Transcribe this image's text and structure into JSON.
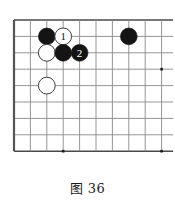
{
  "figure": {
    "caption": "图 36",
    "kind": "go-board-diagram"
  },
  "board": {
    "grid": {
      "origin_x": 14,
      "origin_y": 20,
      "spacing": 16.4,
      "cols": 10,
      "rows": 9,
      "line_color": "#8a8a8a",
      "edge_color": "#4a4a4a",
      "edge_left_color": "#555555",
      "background": "#ffffff"
    },
    "star_points": [
      {
        "name": "star-point-bottom-left",
        "col": 4,
        "row": 9
      },
      {
        "name": "star-point-right",
        "col": 10,
        "row": 4
      },
      {
        "name": "star-point-bottom-right",
        "col": 10,
        "row": 9
      }
    ],
    "star_point_color": "#1a1a1a",
    "stones": [
      {
        "name": "black-stone-a",
        "color": "black",
        "col": 3,
        "row": 2,
        "label": ""
      },
      {
        "name": "white-stone-move-1",
        "color": "white",
        "col": 4,
        "row": 2,
        "label": "1"
      },
      {
        "name": "white-stone-b",
        "color": "white",
        "col": 3,
        "row": 3,
        "label": ""
      },
      {
        "name": "black-stone-c",
        "color": "black",
        "col": 4,
        "row": 3,
        "label": ""
      },
      {
        "name": "black-stone-move-2",
        "color": "black",
        "col": 5,
        "row": 3,
        "label": "2"
      },
      {
        "name": "black-stone-d",
        "color": "black",
        "col": 8,
        "row": 2,
        "label": ""
      },
      {
        "name": "white-stone-e",
        "color": "white",
        "col": 3,
        "row": 5,
        "label": ""
      }
    ],
    "stone_radius": 8.4,
    "colors": {
      "black_fill": "#141414",
      "black_label": "#ffffff",
      "white_fill": "#ffffff",
      "white_stroke": "#3c3c3c",
      "white_label": "#141414"
    }
  }
}
